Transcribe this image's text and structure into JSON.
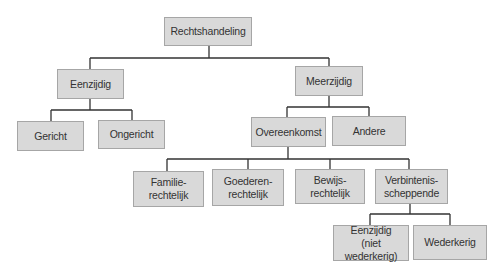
{
  "diagram": {
    "title": "Rechtshandeling",
    "colors": {
      "box_fill": "#d9d9d9",
      "box_border": "#a6a6a6",
      "line": "#333333",
      "text": "#333333"
    },
    "nodes": {
      "root": {
        "label": "Rechtshandeling"
      },
      "eenzijdig": {
        "label": "Eenzijdig"
      },
      "meerzijdig": {
        "label": "Meerzijdig"
      },
      "gericht": {
        "label": "Gericht"
      },
      "ongericht": {
        "label": "Ongericht"
      },
      "overeenkomst": {
        "label": "Overeenkomst"
      },
      "andere": {
        "label": "Andere"
      },
      "familierechtelijk": {
        "label": "Familie-\nrechtelijk"
      },
      "goederenrechtelijk": {
        "label": "Goederen-\nrechtelijk"
      },
      "bewijsrechtelijk": {
        "label": "Bewijs-\nrechtelijk"
      },
      "verbintenisscheppende": {
        "label": "Verbintenis-\nscheppende"
      },
      "eenzijdig_niet_wederkerig": {
        "label": "Eenzijdig\n(niet wederkerig)"
      },
      "wederkerig": {
        "label": "Wederkerig"
      }
    },
    "edges": [
      [
        "root",
        "eenzijdig"
      ],
      [
        "root",
        "meerzijdig"
      ],
      [
        "eenzijdig",
        "gericht"
      ],
      [
        "eenzijdig",
        "ongericht"
      ],
      [
        "meerzijdig",
        "overeenkomst"
      ],
      [
        "meerzijdig",
        "andere"
      ],
      [
        "overeenkomst",
        "familierechtelijk"
      ],
      [
        "overeenkomst",
        "goederenrechtelijk"
      ],
      [
        "overeenkomst",
        "bewijsrechtelijk"
      ],
      [
        "overeenkomst",
        "verbintenisscheppende"
      ],
      [
        "verbintenisscheppende",
        "eenzijdig_niet_wederkerig"
      ],
      [
        "verbintenisscheppende",
        "wederkerig"
      ]
    ]
  }
}
